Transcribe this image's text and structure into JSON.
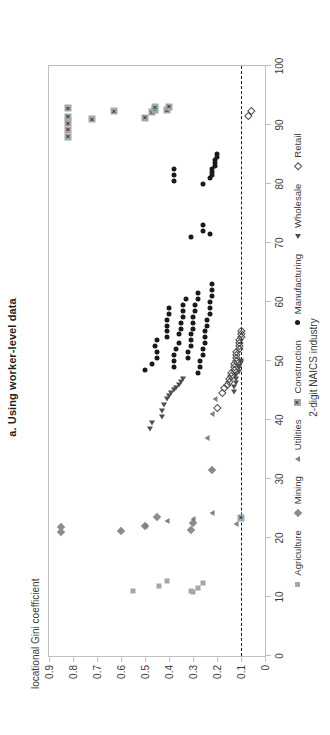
{
  "chart_data": {
    "type": "scatter",
    "title": "a. Using worker-level data",
    "xlabel": "2-digit NAICS industry",
    "ylabel": "locational Gini coefficient",
    "xlim": [
      0,
      100
    ],
    "ylim": [
      0,
      0.9
    ],
    "xticks": [
      0,
      10,
      20,
      30,
      40,
      50,
      60,
      70,
      80,
      90,
      100
    ],
    "xtick_labels": [
      "0",
      "10",
      "20",
      "30",
      "40",
      "50",
      "60",
      "70",
      "80",
      "90",
      "100"
    ],
    "yticks": [
      0,
      0.1,
      0.2,
      0.3,
      0.4,
      0.5,
      0.6,
      0.7,
      0.8,
      0.9
    ],
    "ytick_labels": [
      "0",
      "0.1",
      "0.2",
      "0.3",
      "0.4",
      "0.5",
      "0.6",
      "0.7",
      "0.8",
      "0.9"
    ],
    "grid": false,
    "legend_position": "bottom",
    "reference_line": {
      "axis": "y",
      "value": 0.1,
      "style": "dashed",
      "color": "#1a1a1a"
    },
    "rotation_deg": -90,
    "series": [
      {
        "name": "Agriculture",
        "marker": "filled-square",
        "color": "#a6a6a6",
        "points": [
          [
            11,
            0.55
          ],
          [
            11.9,
            0.44
          ],
          [
            12.7,
            0.41
          ],
          [
            10.8,
            0.3
          ],
          [
            11.1,
            0.31
          ],
          [
            11.5,
            0.28
          ],
          [
            12.3,
            0.26
          ]
        ]
      },
      {
        "name": "Mining",
        "marker": "filled-diamond",
        "color": "#8c8c8c",
        "points": [
          [
            21,
            0.85
          ],
          [
            21.8,
            0.85
          ],
          [
            21.2,
            0.6
          ],
          [
            22.0,
            0.5
          ],
          [
            23.5,
            0.45
          ],
          [
            21.4,
            0.31
          ],
          [
            22.6,
            0.3
          ],
          [
            31.5,
            0.22
          ]
        ]
      },
      {
        "name": "Utilities",
        "marker": "filled-triangle",
        "color": "#808080",
        "points": [
          [
            22.1,
            0.5
          ],
          [
            22.9,
            0.41
          ],
          [
            23.2,
            0.3
          ],
          [
            24.2,
            0.22
          ],
          [
            37.0,
            0.24
          ],
          [
            41.0,
            0.22
          ],
          [
            43.5,
            0.21
          ],
          [
            22.4,
            0.12
          ]
        ]
      },
      {
        "name": "Construction",
        "marker": "boxed-x",
        "color": "#a8a8a8",
        "points": [
          [
            23.4,
            0.1
          ],
          [
            88.0,
            0.82
          ],
          [
            89.2,
            0.82
          ],
          [
            90.3,
            0.82
          ],
          [
            91.4,
            0.82
          ],
          [
            92.8,
            0.82
          ],
          [
            91.0,
            0.72
          ],
          [
            92.3,
            0.63
          ],
          [
            91.2,
            0.5
          ],
          [
            92.2,
            0.47
          ],
          [
            92.6,
            0.46
          ],
          [
            93.0,
            0.46
          ],
          [
            92.5,
            0.41
          ],
          [
            93.1,
            0.4
          ]
        ]
      },
      {
        "name": "Manufacturing",
        "marker": "filled-circle",
        "color": "#1a1a1a",
        "points": [
          [
            48.5,
            0.5
          ],
          [
            49.5,
            0.47
          ],
          [
            50.5,
            0.45
          ],
          [
            51.5,
            0.45
          ],
          [
            52.5,
            0.46
          ],
          [
            53.5,
            0.45
          ],
          [
            54.0,
            0.41
          ],
          [
            55.0,
            0.41
          ],
          [
            56.0,
            0.41
          ],
          [
            57.0,
            0.41
          ],
          [
            58.0,
            0.4
          ],
          [
            59.0,
            0.4
          ],
          [
            49.0,
            0.38
          ],
          [
            50.0,
            0.38
          ],
          [
            51.0,
            0.38
          ],
          [
            52.0,
            0.37
          ],
          [
            53.0,
            0.36
          ],
          [
            54.5,
            0.36
          ],
          [
            55.5,
            0.35
          ],
          [
            56.5,
            0.35
          ],
          [
            57.5,
            0.34
          ],
          [
            58.5,
            0.34
          ],
          [
            59.5,
            0.34
          ],
          [
            60.5,
            0.33
          ],
          [
            50.5,
            0.32
          ],
          [
            51.5,
            0.32
          ],
          [
            52.5,
            0.31
          ],
          [
            53.5,
            0.31
          ],
          [
            54.5,
            0.31
          ],
          [
            55.5,
            0.3
          ],
          [
            56.5,
            0.3
          ],
          [
            57.5,
            0.3
          ],
          [
            58.5,
            0.29
          ],
          [
            59.5,
            0.29
          ],
          [
            60.5,
            0.28
          ],
          [
            61.5,
            0.28
          ],
          [
            48.0,
            0.28
          ],
          [
            49.0,
            0.27
          ],
          [
            50.0,
            0.27
          ],
          [
            51.0,
            0.26
          ],
          [
            52.0,
            0.26
          ],
          [
            53.0,
            0.25
          ],
          [
            54.0,
            0.25
          ],
          [
            55.0,
            0.25
          ],
          [
            56.0,
            0.24
          ],
          [
            57.0,
            0.24
          ],
          [
            58.0,
            0.23
          ],
          [
            59.0,
            0.23
          ],
          [
            60.0,
            0.23
          ],
          [
            61.0,
            0.22
          ],
          [
            62.0,
            0.22
          ],
          [
            63.0,
            0.22
          ],
          [
            71.0,
            0.31
          ],
          [
            72.0,
            0.26
          ],
          [
            73.0,
            0.26
          ],
          [
            71.5,
            0.23
          ],
          [
            80.5,
            0.38
          ],
          [
            81.5,
            0.38
          ],
          [
            82.5,
            0.38
          ],
          [
            80.0,
            0.26
          ],
          [
            81.0,
            0.23
          ],
          [
            81.5,
            0.22
          ],
          [
            82.0,
            0.22
          ],
          [
            82.5,
            0.22
          ],
          [
            83.0,
            0.21
          ],
          [
            83.5,
            0.21
          ],
          [
            84.0,
            0.21
          ],
          [
            84.5,
            0.2
          ],
          [
            85.0,
            0.2
          ]
        ]
      },
      {
        "name": "Wholesale",
        "marker": "open-triangle",
        "color": "#4d4d4d",
        "points": [
          [
            38.5,
            0.48
          ],
          [
            39.5,
            0.47
          ],
          [
            40.5,
            0.43
          ],
          [
            41.5,
            0.43
          ],
          [
            42.5,
            0.42
          ],
          [
            43.5,
            0.41
          ],
          [
            44.0,
            0.4
          ],
          [
            44.5,
            0.39
          ],
          [
            45.0,
            0.38
          ],
          [
            45.5,
            0.37
          ],
          [
            46.0,
            0.36
          ],
          [
            46.5,
            0.35
          ],
          [
            47.0,
            0.34
          ],
          [
            44.8,
            0.13
          ],
          [
            45.6,
            0.13
          ],
          [
            46.3,
            0.12
          ],
          [
            47.0,
            0.12
          ],
          [
            47.6,
            0.12
          ],
          [
            48.2,
            0.11
          ],
          [
            48.8,
            0.11
          ],
          [
            49.2,
            0.11
          ],
          [
            49.6,
            0.1
          ],
          [
            50.0,
            0.1
          ]
        ]
      },
      {
        "name": "Retail",
        "marker": "open-diamond",
        "color": "#4d4d4d",
        "points": [
          [
            42.0,
            0.2
          ],
          [
            44.5,
            0.18
          ],
          [
            45.5,
            0.17
          ],
          [
            46.0,
            0.16
          ],
          [
            46.5,
            0.15
          ],
          [
            47.0,
            0.15
          ],
          [
            47.5,
            0.14
          ],
          [
            48.0,
            0.14
          ],
          [
            48.5,
            0.13
          ],
          [
            49.0,
            0.13
          ],
          [
            49.5,
            0.13
          ],
          [
            50.0,
            0.12
          ],
          [
            50.5,
            0.12
          ],
          [
            51.0,
            0.12
          ],
          [
            51.5,
            0.12
          ],
          [
            52.0,
            0.11
          ],
          [
            52.5,
            0.11
          ],
          [
            53.0,
            0.11
          ],
          [
            53.5,
            0.11
          ],
          [
            54.0,
            0.1
          ],
          [
            54.5,
            0.1
          ],
          [
            55.0,
            0.1
          ],
          [
            91.5,
            0.07
          ],
          [
            92.3,
            0.06
          ]
        ]
      }
    ]
  }
}
